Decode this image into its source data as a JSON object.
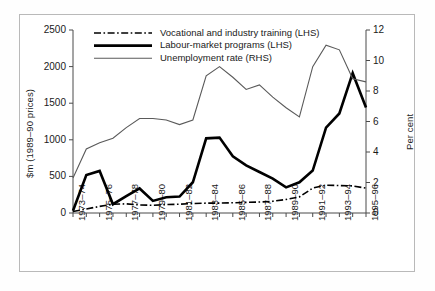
{
  "figure": {
    "background": "#ffffff",
    "border_color": "#b9b9b9"
  },
  "chart_data": {
    "type": "line",
    "title": "",
    "subtitle": "",
    "xlabel": "",
    "ylabel": "$m (1989–90 prices)",
    "ylabel_right": "Per cent",
    "ylim": [
      0,
      2500
    ],
    "yticks": [
      "0",
      "500",
      "1000",
      "1500",
      "2000",
      "2500"
    ],
    "ytick_values": [
      0,
      500,
      1000,
      1500,
      2000,
      2500
    ],
    "ylim_right": [
      0,
      12
    ],
    "yticks_right": [
      "0",
      "2",
      "4",
      "6",
      "8",
      "10",
      "12"
    ],
    "ytick_values_right": [
      0,
      2,
      4,
      6,
      8,
      10,
      12
    ],
    "grid": false,
    "legend_position": "top-center",
    "x": [
      "1973–74",
      "1974–75",
      "1975–76",
      "1976–77",
      "1977–78",
      "1978–79",
      "1979–80",
      "1980–81",
      "1981–82",
      "1982–83",
      "1983–84",
      "1984–85",
      "1985–86",
      "1986–87",
      "1987–88",
      "1988–89",
      "1989–90",
      "1990–91",
      "1991–92",
      "1992–93",
      "1993–94",
      "1994–95",
      "1995–96"
    ],
    "xtick_labels": [
      "1973–74",
      "1975–76",
      "1977–78",
      "1979–80",
      "1981–82",
      "1983–84",
      "1985–86",
      "1987–88",
      "1989–90",
      "1991–92",
      "1993–94",
      "1995–96"
    ],
    "xtick_label_indices": [
      0,
      2,
      4,
      6,
      8,
      10,
      12,
      14,
      16,
      18,
      20,
      22
    ],
    "series": [
      {
        "name": "Vocational and industry training (LHS)",
        "axis": "left",
        "style": "dash-dot",
        "color": "#000000",
        "width": 1.6,
        "values": [
          20,
          55,
          90,
          120,
          125,
          110,
          105,
          115,
          120,
          130,
          135,
          135,
          140,
          145,
          150,
          160,
          185,
          220,
          340,
          380,
          375,
          370,
          340
        ]
      },
      {
        "name": "Labour-market programs (LHS)",
        "axis": "left",
        "style": "solid-thick",
        "color": "#000000",
        "width": 2.6,
        "values": [
          30,
          520,
          575,
          120,
          230,
          335,
          165,
          215,
          225,
          420,
          1020,
          1030,
          775,
          650,
          560,
          470,
          350,
          420,
          580,
          1165,
          1360,
          1910,
          1440
        ]
      },
      {
        "name": "Unemployment rate (RHS)",
        "axis": "right",
        "style": "solid-thin",
        "color": "#5a5a5a",
        "width": 1.1,
        "values": [
          2.3,
          4.2,
          4.6,
          4.9,
          5.6,
          6.2,
          6.2,
          6.1,
          5.8,
          6.1,
          9.0,
          9.6,
          8.9,
          8.1,
          8.4,
          7.6,
          6.9,
          6.3,
          9.6,
          11.0,
          10.7,
          8.8,
          8.6
        ]
      }
    ]
  },
  "legend": {
    "items": [
      {
        "label": "Vocational and industry training (LHS)",
        "style": "dash-dot"
      },
      {
        "label": "Labour-market programs (LHS)",
        "style": "solid-thick"
      },
      {
        "label": "Unemployment rate (RHS)",
        "style": "solid-thin"
      }
    ]
  }
}
